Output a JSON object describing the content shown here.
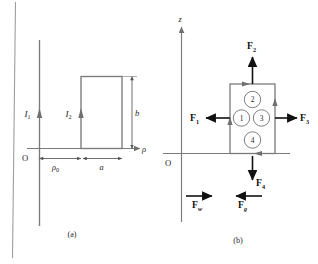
{
  "figure": {
    "background": "#ffffff",
    "ink": "#7a7a7a",
    "ink_dark": "#111111",
    "page_edge_color": "#9a9a9a"
  },
  "panel_a": {
    "caption": "(a)",
    "axis_horizontal_label": "ρ",
    "origin_label": "O",
    "wire_label": "I",
    "wire_sub": "1",
    "loop_label": "I",
    "loop_sub": "2",
    "dim_width_label": "a",
    "dim_height_label": "b",
    "dim_offset_label": "ρ",
    "dim_offset_sub": "0"
  },
  "panel_b": {
    "caption": "(b)",
    "axis_vertical_label": "z",
    "origin_label": "O",
    "circles": [
      {
        "id": "1",
        "label": "1"
      },
      {
        "id": "2",
        "label": "2"
      },
      {
        "id": "3",
        "label": "3"
      },
      {
        "id": "4",
        "label": "4"
      }
    ],
    "forces": [
      {
        "name": "F1",
        "symbol": "F",
        "sub": "1",
        "direction": "left"
      },
      {
        "name": "F2",
        "symbol": "F",
        "sub": "2",
        "direction": "up"
      },
      {
        "name": "F3",
        "symbol": "F",
        "sub": "3",
        "direction": "right"
      },
      {
        "name": "F4",
        "symbol": "F",
        "sub": "4",
        "direction": "down"
      },
      {
        "name": "Fw",
        "symbol": "F",
        "sub": "w",
        "direction": "right"
      },
      {
        "name": "Fg",
        "symbol": "F",
        "sub": "g",
        "direction": "left"
      }
    ]
  }
}
